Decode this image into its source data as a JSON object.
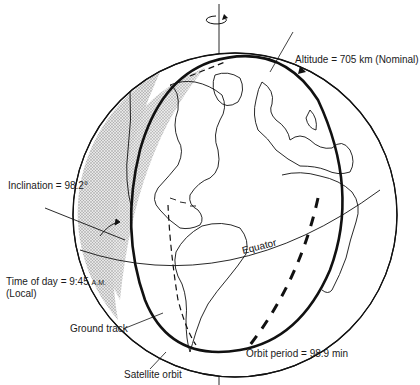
{
  "diagram": {
    "title": "",
    "labels": {
      "altitude": "Altitude = 705 km (Nominal)",
      "inclination": "Inclination = 98.2°",
      "time_of_day": "Time of day = 9:45",
      "time_suffix": "A.M.",
      "local": "(Local)",
      "ground_track": "Ground track",
      "satellite_orbit": "Satellite orbit",
      "orbit_period": "Orbit period = 98.9 min",
      "equator": "Equator"
    },
    "elements": {
      "rotation_axis": "Earth rotation axis with rotation arrow",
      "globe": "Earth globe showing Americas, Europe and Africa",
      "night_side": "Shaded (stippled) night terminator region on left limb",
      "orbit": "Bold elliptical satellite orbit path with direction arrow",
      "ground_track": "Dashed ground track line on globe surface"
    },
    "colors": {
      "line": "#111111",
      "shade": "#c8c8c8",
      "background": "#ffffff"
    }
  }
}
